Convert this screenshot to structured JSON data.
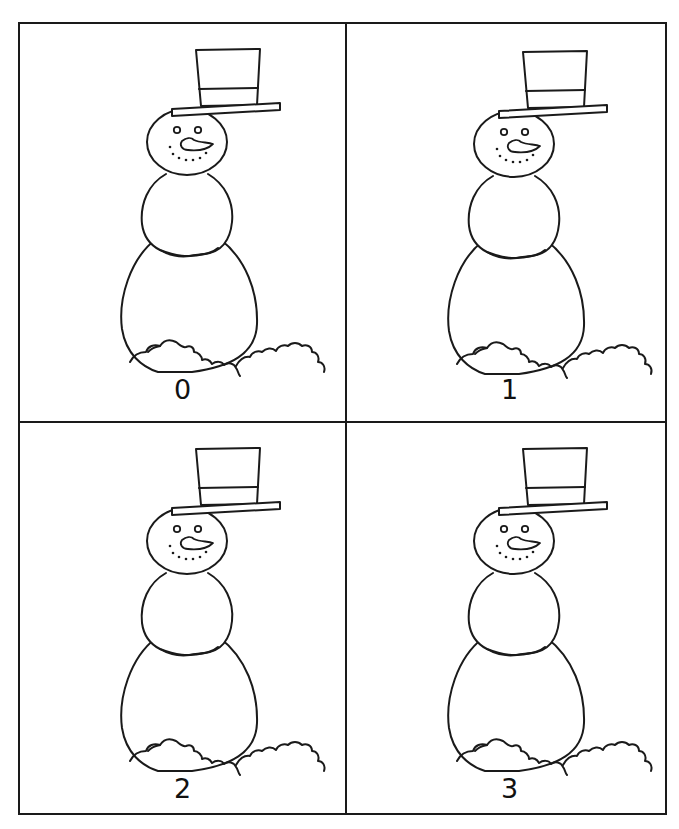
{
  "worksheet": {
    "title": "",
    "stroke_color": "#1a1a1a",
    "background_color": "#ffffff"
  },
  "cards": [
    {
      "label": "0",
      "image": "snowman-icon",
      "parts": [
        "top-hat",
        "head",
        "eyes",
        "carrot-nose",
        "dotted-smile",
        "middle-ball",
        "bottom-ball",
        "snow-mound"
      ]
    },
    {
      "label": "1",
      "image": "snowman-icon",
      "parts": [
        "top-hat",
        "head",
        "eyes",
        "carrot-nose",
        "dotted-smile",
        "middle-ball",
        "bottom-ball",
        "snow-mound"
      ]
    },
    {
      "label": "2",
      "image": "snowman-icon",
      "parts": [
        "top-hat",
        "head",
        "eyes",
        "carrot-nose",
        "dotted-smile",
        "middle-ball",
        "bottom-ball",
        "snow-mound"
      ]
    },
    {
      "label": "3",
      "image": "snowman-icon",
      "parts": [
        "top-hat",
        "head",
        "eyes",
        "carrot-nose",
        "dotted-smile",
        "middle-ball",
        "bottom-ball",
        "snow-mound"
      ]
    }
  ]
}
